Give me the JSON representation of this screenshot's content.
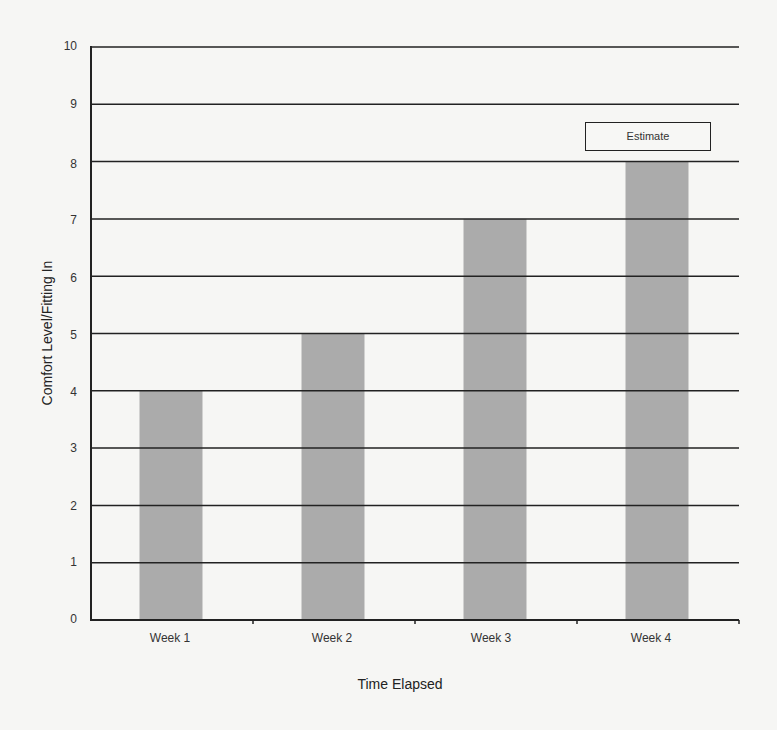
{
  "chart_data": {
    "type": "bar",
    "title": "",
    "xlabel": "Time Elapsed",
    "ylabel": "Comfort Level/Fitting In",
    "categories": [
      "Week 1",
      "Week 2",
      "Week 3",
      "Week 4"
    ],
    "values": [
      4,
      5,
      7,
      8
    ],
    "ylim": [
      0,
      10
    ],
    "yticks": [
      0,
      1,
      2,
      3,
      4,
      5,
      6,
      7,
      8,
      9,
      10
    ],
    "grid": true,
    "legend": {
      "position": "upper right",
      "entries": [
        "Estimate"
      ]
    },
    "bar_color": "#ababab",
    "grid_color": "#222222"
  },
  "labels": {
    "x_title": "Time Elapsed",
    "y_title": "Comfort Level/Fitting In",
    "legend": "Estimate",
    "yticks": [
      "0",
      "1",
      "2",
      "3",
      "4",
      "5",
      "6",
      "7",
      "8",
      "9",
      "10"
    ],
    "categories": [
      "Week 1",
      "Week 2",
      "Week 3",
      "Week 4"
    ]
  }
}
